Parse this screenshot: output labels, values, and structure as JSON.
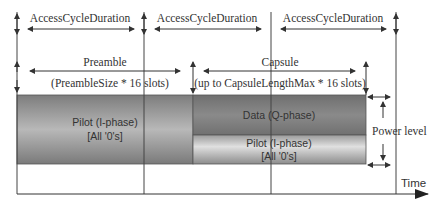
{
  "top_row": {
    "labels": [
      "AccessCycleDuration",
      "AccessCycleDuration",
      "AccessCycleDuration"
    ]
  },
  "preamble": {
    "title": "Preamble",
    "subtitle": "(PreambleSize * 16 slots)"
  },
  "capsule": {
    "title": "Capsule",
    "subtitle": "(up to CapsuleLengthMax * 16 slots)"
  },
  "blocks": {
    "preamble_pilot": {
      "line1": "Pilot (I-phase)",
      "line2": "[All '0's]"
    },
    "capsule_data": {
      "line1": "Data (Q-phase)"
    },
    "capsule_pilot": {
      "line1": "Pilot (I-phase)",
      "line2": "[All '0's]"
    }
  },
  "power_level_label": "Power level",
  "axis": {
    "time_label": "Time"
  },
  "colors": {
    "preamble_block": "#8f8f8f",
    "data_block": "#7a7a7a",
    "pilot_block_light": "#c9c9c9",
    "lines": "#333333"
  }
}
